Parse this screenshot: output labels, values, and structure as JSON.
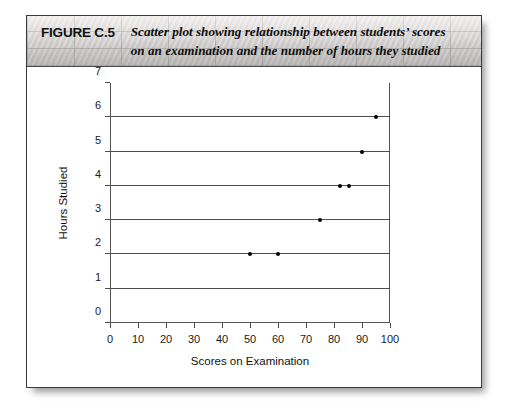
{
  "figure": {
    "number_label": "FIGURE C.5",
    "caption_line1": "Scatter plot showing relationship between students’ scores",
    "caption_line2": "on an examination and the number of hours they studied"
  },
  "chart_data": {
    "type": "scatter",
    "title": "Scatter plot showing relationship between students’ scores on an examination and the number of hours they studied",
    "xlabel": "Scores on Examination",
    "ylabel": "Hours Studied",
    "xlim": [
      0,
      100
    ],
    "ylim": [
      0,
      7
    ],
    "xticks": [
      0,
      10,
      20,
      30,
      40,
      50,
      60,
      70,
      80,
      90,
      100
    ],
    "yticks": [
      0,
      1,
      2,
      3,
      4,
      5,
      6,
      7
    ],
    "gridlines_y": [
      1,
      2,
      3,
      4,
      5,
      6
    ],
    "grid": "horizontal",
    "legend": "none",
    "marker_color": "#000000",
    "points": [
      {
        "x": 50,
        "y": 2
      },
      {
        "x": 60,
        "y": 2
      },
      {
        "x": 75,
        "y": 3
      },
      {
        "x": 82,
        "y": 4
      },
      {
        "x": 85.5,
        "y": 4
      },
      {
        "x": 90,
        "y": 5
      },
      {
        "x": 95,
        "y": 6
      }
    ]
  }
}
